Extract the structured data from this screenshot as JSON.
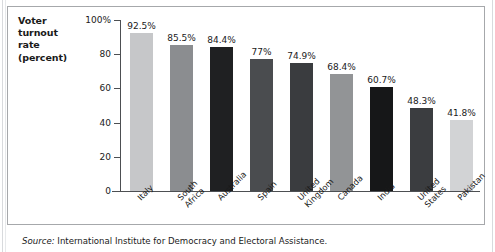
{
  "figure": {
    "axis_title_lines": [
      "Voter",
      "turnout",
      "rate",
      "(percent)"
    ],
    "source_prefix": "Source:",
    "source_text": "International Institute for Democracy and Electoral Assistance."
  },
  "chart_data": {
    "type": "bar",
    "title": "",
    "xlabel": "",
    "ylabel": "Voter turnout rate (percent)",
    "ylim": [
      0,
      100
    ],
    "grid": false,
    "legend": "none",
    "ytick_labels": [
      "100%",
      "80",
      "60",
      "40",
      "20",
      "0"
    ],
    "ytick_values": [
      100,
      80,
      60,
      40,
      20,
      0
    ],
    "categories": [
      "Italy",
      "South Africa",
      "Australia",
      "Spain",
      "United Kingdom",
      "Canada",
      "India",
      "United States",
      "Pakistan"
    ],
    "category_lines": [
      [
        "Italy"
      ],
      [
        "South",
        "Africa"
      ],
      [
        "Australia"
      ],
      [
        "Spain"
      ],
      [
        "United",
        "Kingdom"
      ],
      [
        "Canada"
      ],
      [
        "India"
      ],
      [
        "United",
        "States"
      ],
      [
        "Pakistan"
      ]
    ],
    "values": [
      92.5,
      85.5,
      84.4,
      77,
      74.9,
      68.4,
      60.7,
      48.3,
      41.8
    ],
    "value_labels": [
      "92.5%",
      "85.5%",
      "84.4%",
      "77%",
      "74.9%",
      "68.4%",
      "60.7%",
      "48.3%",
      "41.8%"
    ],
    "bar_colors": [
      "#c6c7c9",
      "#8b8d90",
      "#1f2022",
      "#4a4c4f",
      "#3a3c3f",
      "#929496",
      "#161718",
      "#3b3d40",
      "#d2d3d5"
    ]
  }
}
